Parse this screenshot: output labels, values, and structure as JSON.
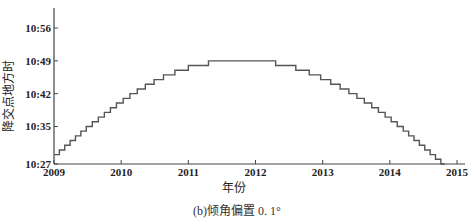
{
  "chart_data": {
    "type": "line",
    "step": true,
    "title": "",
    "caption": "(b)倾角偏置 0. 1°",
    "xlabel": "年份",
    "ylabel": "降交点地方时",
    "x_ticks": [
      "2009",
      "2010",
      "2011",
      "2012",
      "2013",
      "2014",
      "2015"
    ],
    "y_ticks": [
      "10:27",
      "10:35",
      "10:42",
      "10:49",
      "10:56"
    ],
    "xlim": [
      2009,
      2015
    ],
    "ylim_minutes": [
      627,
      660
    ],
    "grid": false,
    "legend": null,
    "series": [
      {
        "name": "降交点地方时",
        "color": "#555555",
        "x": [
          2009.0,
          2009.08,
          2009.16,
          2009.24,
          2009.32,
          2009.4,
          2009.48,
          2009.57,
          2009.66,
          2009.75,
          2009.84,
          2009.93,
          2010.03,
          2010.13,
          2010.24,
          2010.36,
          2010.49,
          2010.63,
          2010.8,
          2011.0,
          2011.3,
          2012.3,
          2012.6,
          2012.8,
          2012.97,
          2013.12,
          2013.26,
          2013.39,
          2013.51,
          2013.62,
          2013.73,
          2013.83,
          2013.93,
          2014.02,
          2014.11,
          2014.2,
          2014.28,
          2014.36,
          2014.44,
          2014.52,
          2014.6,
          2014.68,
          2014.76
        ],
        "y_minutes": [
          629,
          630,
          631,
          632,
          633,
          634,
          635,
          636,
          637,
          638,
          639,
          640,
          641,
          642,
          643,
          644,
          645,
          646,
          647,
          648,
          649,
          648,
          647,
          646,
          645,
          644,
          643,
          642,
          641,
          640,
          639,
          638,
          637,
          636,
          635,
          634,
          633,
          632,
          631,
          630,
          629,
          628,
          627
        ]
      }
    ]
  }
}
